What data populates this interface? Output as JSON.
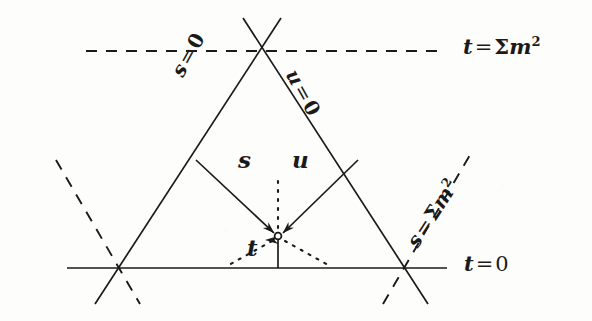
{
  "figure": {
    "kind": "mandelstam-triangle-diagram",
    "background_color": "#fdfdfc",
    "ink_color": "#1a1a1a",
    "labels": {
      "t_equals_sum_m_squared": {
        "var": "t",
        "op": "=",
        "sigma": "Σ",
        "mass": "m",
        "exponent": "2",
        "full_text": "t = Σm²"
      },
      "t_equals_zero": {
        "var": "t",
        "op": "=",
        "value": "0",
        "full_text": "t = 0"
      },
      "s_equals_zero": {
        "var": "s",
        "op": "=",
        "value": "0",
        "full_text": "s = 0"
      },
      "u_equals_zero": {
        "var": "u",
        "op": "=",
        "value": "0",
        "full_text": "u = 0"
      },
      "s_equals_sum_m_squared": {
        "var": "s",
        "op": "=",
        "sigma": "Σ",
        "mass": "m",
        "exponent": "2",
        "full_text": "s = Σm²"
      },
      "arrow_s": "s",
      "arrow_u": "u",
      "arrow_t": "t"
    },
    "geometry": {
      "apex": [
        262,
        36
      ],
      "base_left_vertex": [
        117,
        268
      ],
      "base_right_vertex": [
        403,
        268
      ],
      "interior_point": [
        278,
        236
      ],
      "line_t_zero_y": 268,
      "line_t_sum_m2_y": 51,
      "stroke_width": 1.7,
      "dash_pattern": "10 8",
      "dot_pattern": "1.5 6"
    }
  }
}
